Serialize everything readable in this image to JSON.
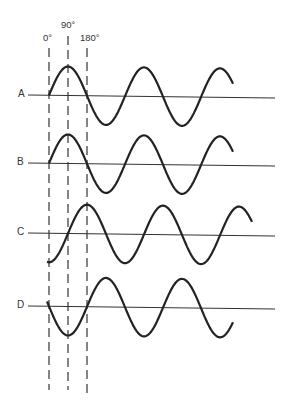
{
  "diagram": {
    "type": "phase-comparison",
    "phase_markers": [
      {
        "label": "0°",
        "x": 49
      },
      {
        "label": "90°",
        "x": 68
      },
      {
        "label": "180°",
        "x": 87
      }
    ],
    "waves": [
      {
        "label": "A",
        "axis_y": 95,
        "start_x": 49,
        "end_x": 233,
        "phase_deg": 0,
        "note": "starts at zero going up, peak at 90°"
      },
      {
        "label": "B",
        "axis_y": 163,
        "start_x": 49,
        "end_x": 233,
        "phase_deg": 0,
        "note": "in phase with A"
      },
      {
        "label": "C",
        "axis_y": 233,
        "start_x": 47,
        "end_x": 252,
        "phase_deg": -90,
        "note": "starts at negative peak, lags A by 90°"
      },
      {
        "label": "D",
        "axis_y": 306,
        "start_x": 47,
        "end_x": 233,
        "phase_deg": 180,
        "note": "starts at zero going down, 180° out of phase with A"
      }
    ],
    "amplitude_px": 29,
    "period_px": 76,
    "line_color": "#222222",
    "dash_color": "#444444"
  }
}
